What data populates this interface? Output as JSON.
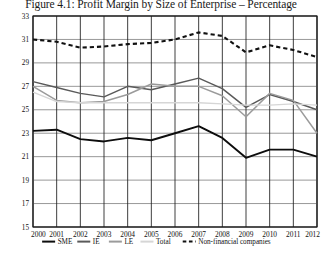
{
  "figure": {
    "title": "Figure 4.1: Profit Margin by Size of Enterprise – Percentage"
  },
  "chart_data": {
    "type": "line",
    "title": "Figure 4.1: Profit Margin by Size of Enterprise – Percentage",
    "xlabel": "",
    "ylabel": "",
    "ylim": [
      15,
      33
    ],
    "ytick_step": 2,
    "yticks": [
      "33",
      "31",
      "29",
      "27",
      "25",
      "23",
      "21",
      "19",
      "17",
      "15"
    ],
    "grid": true,
    "legend_position": "bottom",
    "categories": [
      "2000",
      "2001",
      "2002",
      "2003",
      "2004",
      "2005",
      "2006",
      "2007",
      "2008",
      "2009",
      "2010",
      "2011",
      "2012"
    ],
    "series": [
      {
        "name": "SME",
        "color": "#0d0d0d",
        "style": "solid",
        "width": 1.9,
        "values": [
          23.2,
          23.3,
          22.5,
          22.3,
          22.6,
          22.4,
          23.0,
          23.6,
          22.6,
          20.9,
          21.6,
          21.6,
          21.0
        ]
      },
      {
        "name": "IE",
        "color": "#5a5a5a",
        "style": "solid",
        "width": 1.5,
        "values": [
          27.4,
          26.9,
          26.4,
          26.1,
          27.0,
          26.7,
          27.2,
          27.7,
          26.8,
          25.2,
          26.3,
          25.7,
          25.0
        ]
      },
      {
        "name": "LE",
        "color": "#9b9b9b",
        "style": "solid",
        "width": 1.5,
        "values": [
          27.0,
          25.8,
          25.6,
          25.7,
          26.3,
          27.2,
          27.0,
          27.0,
          26.2,
          24.4,
          26.4,
          25.8,
          23.0
        ]
      },
      {
        "name": "Total",
        "color": "#d6d6d6",
        "style": "solid",
        "width": 1.4,
        "values": [
          26.5,
          25.7,
          25.6,
          25.6,
          25.6,
          25.6,
          25.6,
          25.6,
          25.5,
          25.4,
          25.4,
          25.5,
          25.4
        ]
      },
      {
        "name": "Non-financial companies",
        "color": "#111111",
        "style": "dashed",
        "width": 2.1,
        "values": [
          31.0,
          30.8,
          30.3,
          30.4,
          30.6,
          30.7,
          31.0,
          31.6,
          31.3,
          29.9,
          30.5,
          30.1,
          29.5
        ]
      }
    ],
    "legend": [
      {
        "label": "SME",
        "color": "#0d0d0d",
        "style": "solid"
      },
      {
        "label": "IE",
        "color": "#5a5a5a",
        "style": "solid"
      },
      {
        "label": "LE",
        "color": "#9b9b9b",
        "style": "solid"
      },
      {
        "label": "Total",
        "color": "#d6d6d6",
        "style": "solid"
      },
      {
        "label": "Non-financial companies",
        "color": "#111111",
        "style": "dashed"
      }
    ]
  }
}
